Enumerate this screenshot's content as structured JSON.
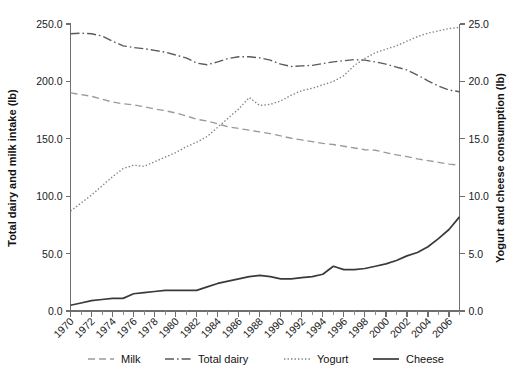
{
  "chart_data": {
    "type": "line",
    "title": "",
    "subtitle": "",
    "xlabel": "",
    "ylabel": "Total dairy and milk intake (lb)",
    "ylabel_right": "Yogurt and cheese consumption (lb)",
    "grid": false,
    "legend_position": "bottom",
    "xlim": [
      1970,
      2007
    ],
    "ylim": [
      0,
      250
    ],
    "ylim_right": [
      0,
      25
    ],
    "x": [
      1970,
      1971,
      1972,
      1973,
      1974,
      1975,
      1976,
      1977,
      1978,
      1979,
      1980,
      1981,
      1982,
      1983,
      1984,
      1985,
      1986,
      1987,
      1988,
      1989,
      1990,
      1991,
      1992,
      1993,
      1994,
      1995,
      1996,
      1997,
      1998,
      1999,
      2000,
      2001,
      2002,
      2003,
      2004,
      2005,
      2006,
      2007
    ],
    "xticks_major": [
      1970,
      1972,
      1974,
      1976,
      1978,
      1980,
      1982,
      1984,
      1986,
      1988,
      1990,
      1992,
      1994,
      1996,
      1998,
      2000,
      2002,
      2004,
      2006
    ],
    "yticks_left": [
      "0.0",
      "50.0",
      "100.0",
      "150.0",
      "200.0",
      "250.0"
    ],
    "yticks_right": [
      "0.0",
      "5.0",
      "10.0",
      "15.0",
      "20.0",
      "25.0"
    ],
    "series": [
      {
        "name": "Milk",
        "axis": "left",
        "style": "dashed",
        "values": [
          190.0,
          188.5,
          187.0,
          184.5,
          182.0,
          180.5,
          179.5,
          178.0,
          176.0,
          174.5,
          172.5,
          170.0,
          167.0,
          165.5,
          163.0,
          160.5,
          159.0,
          157.5,
          156.0,
          154.5,
          152.5,
          150.5,
          149.0,
          147.5,
          146.0,
          145.0,
          143.5,
          142.0,
          140.5,
          140.0,
          138.0,
          136.0,
          134.5,
          132.5,
          131.0,
          129.5,
          128.0,
          127.0
        ]
      },
      {
        "name": "Total dairy",
        "axis": "left",
        "style": "dashdot",
        "values": [
          241.5,
          242.0,
          241.5,
          239.5,
          235.0,
          231.0,
          229.5,
          228.5,
          227.0,
          225.5,
          223.0,
          220.5,
          216.0,
          214.5,
          217.0,
          220.0,
          221.5,
          221.5,
          220.5,
          218.5,
          215.0,
          213.0,
          213.5,
          214.0,
          215.5,
          217.0,
          218.0,
          219.0,
          218.5,
          217.0,
          215.0,
          212.5,
          210.0,
          205.5,
          200.5,
          196.0,
          192.5,
          191.0
        ]
      },
      {
        "name": "Yogurt",
        "axis": "right",
        "style": "dotted",
        "values": [
          8.7,
          9.4,
          10.1,
          10.9,
          11.7,
          12.4,
          12.7,
          12.6,
          13.0,
          13.4,
          13.8,
          14.3,
          14.7,
          15.2,
          16.0,
          16.8,
          17.6,
          18.6,
          17.9,
          18.0,
          18.3,
          18.8,
          19.2,
          19.4,
          19.7,
          20.0,
          20.5,
          21.4,
          22.0,
          22.5,
          22.8,
          23.1,
          23.5,
          23.9,
          24.2,
          24.4,
          24.6,
          24.7
        ]
      },
      {
        "name": "Cheese",
        "axis": "right",
        "style": "solid",
        "values": [
          0.5,
          0.7,
          0.9,
          1.0,
          1.1,
          1.1,
          1.5,
          1.6,
          1.7,
          1.8,
          1.8,
          1.8,
          1.8,
          2.1,
          2.4,
          2.6,
          2.8,
          3.0,
          3.1,
          3.0,
          2.8,
          2.8,
          2.9,
          3.0,
          3.2,
          3.9,
          3.6,
          3.6,
          3.7,
          3.9,
          4.1,
          4.4,
          4.8,
          5.1,
          5.6,
          6.3,
          7.1,
          8.2
        ]
      }
    ],
    "legend": [
      {
        "label": "Milk",
        "style": "dashed"
      },
      {
        "label": "Total dairy",
        "style": "dashdot"
      },
      {
        "label": "Yogurt",
        "style": "dotted"
      },
      {
        "label": "Cheese",
        "style": "solid"
      }
    ],
    "colors": {
      "milk": "#9a9a9a",
      "total_dairy": "#5a5a5a",
      "yogurt": "#808080",
      "cheese": "#3a3a3a",
      "axis": "#6e6e6e",
      "text": "#1a1a1a"
    }
  }
}
